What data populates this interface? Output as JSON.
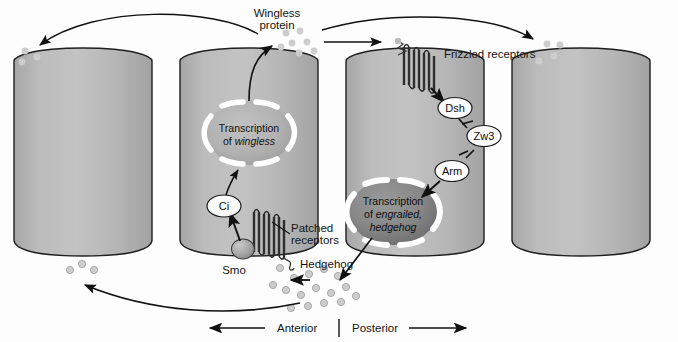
{
  "figure": {
    "title_fragment": "",
    "background_color": "#fdfdfd",
    "cell_fill": "#b4b4b4",
    "cell_stroke": "#1a1a1a",
    "nucleus_fill_light": "#b0b0b0",
    "nucleus_fill_dark": "#8a8a8a",
    "nucleus_ring_color": "#ffffff",
    "particle_color": "#c6c6c6",
    "accent_line_color": "#111111"
  },
  "labels": {
    "wingless_protein": "Wingless\nprotein",
    "wingless_protein_line1": "Wingless",
    "wingless_protein_line2": "protein",
    "frizzled_receptors": "Frizzled receptors",
    "patched_receptors_line1": "Patched",
    "patched_receptors_line2": "receptors",
    "hedgehog": "Hedgehog",
    "smo": "Smo",
    "ci": "Ci",
    "dsh": "Dsh",
    "zw3": "Zw3",
    "arm": "Arm",
    "anterior": "Anterior",
    "posterior": "Posterior"
  },
  "nuclei": [
    {
      "id": "wingless-nucleus",
      "line1": "Transcription",
      "line2_prefix": "of ",
      "line2_italic": "wingless",
      "shade": "light"
    },
    {
      "id": "engrailed-hedgehog-nucleus",
      "line1": "Transcription",
      "line2_prefix": "of ",
      "line2_italic": "engrailed,",
      "line3_italic": "hedgehog",
      "shade": "dark"
    }
  ],
  "cells": [
    {
      "id": "cell-1",
      "role": "anterior-neighbor-cell"
    },
    {
      "id": "cell-2",
      "role": "wingless-expressing-cell"
    },
    {
      "id": "cell-3",
      "role": "engrailed-hedgehog-expressing-cell"
    },
    {
      "id": "cell-4",
      "role": "posterior-neighbor-cell"
    }
  ],
  "signaling_chain": {
    "wnt_branch": [
      "Frizzled receptors",
      "Dsh",
      "Zw3",
      "Arm",
      "Transcription of engrailed, hedgehog"
    ],
    "hh_branch": [
      "Patched receptors",
      "Smo",
      "Ci",
      "Transcription of wingless"
    ],
    "inhibitory_steps": [
      "Dsh -| Zw3",
      "Zw3 -| Arm"
    ]
  },
  "axis": {
    "left_label": "Anterior",
    "right_label": "Posterior",
    "left_arrow": "←",
    "right_arrow": "→",
    "divider": "|"
  }
}
